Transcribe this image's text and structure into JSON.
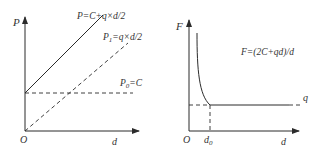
{
  "colors": {
    "line": "#2b2b2b",
    "text": "#333333",
    "background": "#ffffff"
  },
  "left_diagram": {
    "y_axis_label": "P",
    "x_axis_label": "d",
    "origin_label": "O",
    "curves": [
      {
        "label": "P=C+q×d/2",
        "style": "solid",
        "description": "total, starts at C and rises linearly"
      },
      {
        "label_main": "P",
        "label_sub": "1",
        "label_rest": "=q×d/2",
        "style": "dashed",
        "description": "linear from origin"
      },
      {
        "label_main": "P",
        "label_sub": "0",
        "label_rest": "=C",
        "style": "dashed",
        "description": "constant horizontal"
      }
    ]
  },
  "right_diagram": {
    "y_axis_label": "F",
    "x_axis_label": "d",
    "origin_label": "O",
    "x_marker_main": "d",
    "x_marker_sub": "0",
    "curve_label": "F=(2C+qd)/d",
    "asymptote_label": "q"
  }
}
